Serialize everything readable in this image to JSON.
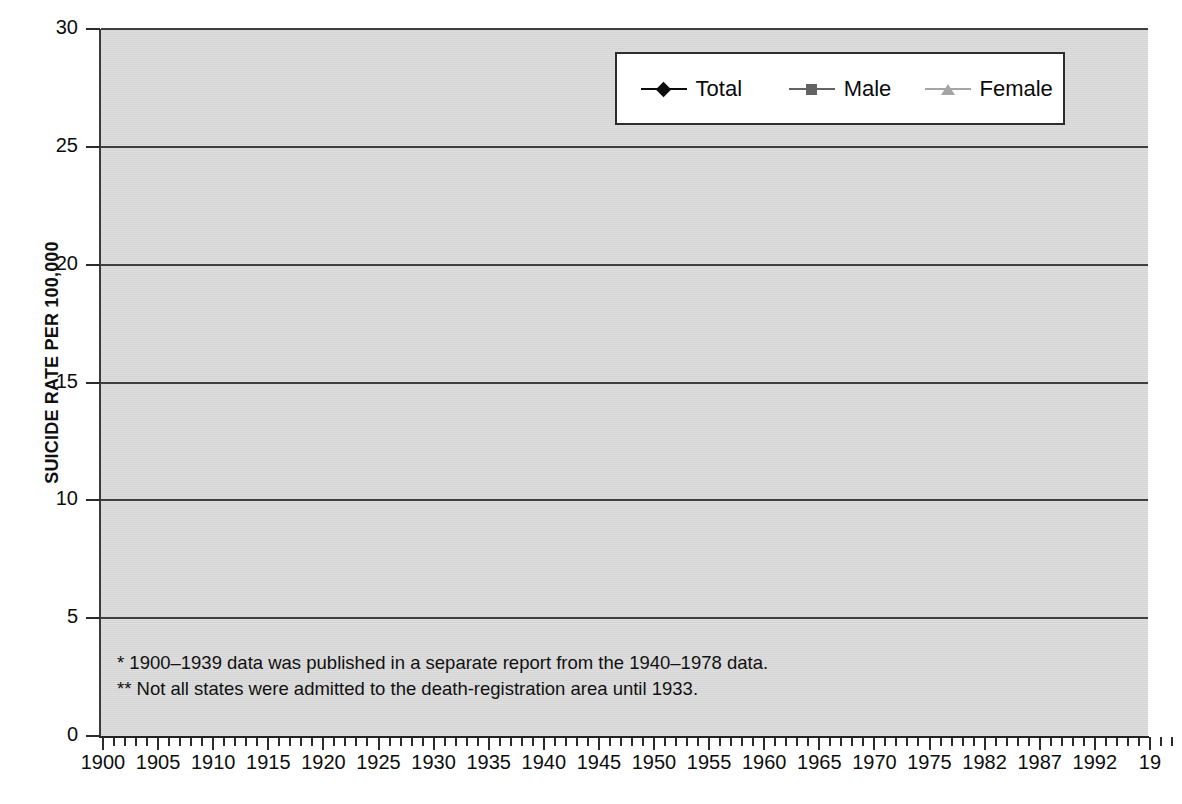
{
  "chart_data": {
    "type": "line",
    "title": "",
    "xlabel": "",
    "ylabel": "SUICIDE RATE PER 100,000",
    "ylim": [
      0,
      30
    ],
    "yticks": [
      0,
      5,
      10,
      15,
      20,
      25,
      30
    ],
    "xlim": [
      1900,
      1997
    ],
    "xtick_labels": [
      "1900",
      "1905",
      "1910",
      "1915",
      "1920",
      "1925",
      "1930",
      "1935",
      "1940",
      "1945",
      "1950",
      "1955",
      "1960",
      "1965",
      "1970",
      "1975",
      "1982",
      "1987",
      "1992",
      "19"
    ],
    "xtick_years": [
      1900,
      1905,
      1910,
      1915,
      1920,
      1925,
      1930,
      1935,
      1940,
      1945,
      1950,
      1955,
      1960,
      1965,
      1970,
      1975,
      1980,
      1985,
      1990,
      1995
    ],
    "grid": "horizontal",
    "legend_position": "top-right",
    "x": [
      1900,
      1901,
      1902,
      1903,
      1904,
      1905,
      1906,
      1907,
      1908,
      1909,
      1910,
      1911,
      1912,
      1913,
      1914,
      1915,
      1916,
      1917,
      1918,
      1919,
      1920,
      1921,
      1922,
      1923,
      1924,
      1925,
      1926,
      1927,
      1928,
      1929,
      1930,
      1931,
      1932,
      1933,
      1934,
      1935,
      1936,
      1937,
      1938,
      1939,
      1940,
      1941,
      1942,
      1943,
      1944,
      1945,
      1946,
      1947,
      1948,
      1949,
      1950,
      1951,
      1952,
      1953,
      1954,
      1955,
      1956,
      1957,
      1958,
      1959,
      1960,
      1961,
      1962,
      1963,
      1964,
      1965,
      1966,
      1967,
      1968,
      1969,
      1970,
      1971,
      1972,
      1973,
      1974,
      1975,
      1976,
      1977,
      1978,
      1979,
      1980,
      1981,
      1982,
      1983,
      1984,
      1985,
      1986,
      1987,
      1988,
      1989,
      1990,
      1991,
      1992,
      1993,
      1994,
      1995,
      1996,
      1997
    ],
    "series": [
      {
        "name": "Total",
        "color": "#0d0d0d",
        "marker": "diamond",
        "values": [
          11.3,
          11.6,
          11.6,
          12.2,
          13.4,
          14.9,
          14.3,
          16.1,
          18.6,
          17.6,
          17.4,
          17.5,
          17.1,
          17.0,
          17.6,
          17.9,
          15.3,
          14.6,
          13.1,
          12.8,
          11.5,
          13.9,
          13.2,
          12.9,
          13.4,
          14.1,
          14.6,
          15.1,
          15.4,
          16.9,
          18.0,
          18.6,
          17.0,
          15.7,
          15.4,
          15.0,
          15.5,
          15.3,
          14.4,
          14.3,
          12.0,
          10.2,
          10.1,
          11.5,
          11.6,
          11.6,
          11.4,
          11.6,
          11.2,
          11.4,
          11.3,
          10.4,
          10.1,
          10.1,
          10.2,
          10.2,
          10.0,
          9.8,
          10.7,
          10.6,
          10.6,
          10.4,
          11.0,
          11.4,
          11.2,
          11.4,
          10.9,
          10.8,
          10.7,
          11.1,
          11.6,
          11.7,
          12.0,
          12.0,
          12.1,
          12.7,
          12.5,
          13.1,
          12.5,
          12.4,
          11.9,
          12.0,
          12.2,
          12.1,
          12.4,
          12.5,
          12.8,
          12.7,
          12.4,
          12.2,
          12.4,
          12.2,
          12.0,
          12.1,
          12.0,
          11.9,
          11.6,
          11.4
        ]
      },
      {
        "name": "Male",
        "color": "#636363",
        "marker": "square",
        "values": [
          17.7,
          17.8,
          17.5,
          17.6,
          19.3,
          20.6,
          22.7,
          21.9,
          24.5,
          28.4,
          26.9,
          25.5,
          26.5,
          26.3,
          25.7,
          26.8,
          26.8,
          23.2,
          20.1,
          20.0,
          18.4,
          21.1,
          19.2,
          19.1,
          20.2,
          20.1,
          20.9,
          21.9,
          23.0,
          24.2,
          26.2,
          28.5,
          29.4,
          26.6,
          24.1,
          22.8,
          22.5,
          23.9,
          23.8,
          22.1,
          21.9,
          19.4,
          18.3,
          15.1,
          14.9,
          17.2,
          17.5,
          17.3,
          17.9,
          17.8,
          17.3,
          16.3,
          15.8,
          16.1,
          16.9,
          16.4,
          15.6,
          15.3,
          16.8,
          16.6,
          16.5,
          16.2,
          16.8,
          16.6,
          16.4,
          16.4,
          16.1,
          15.8,
          15.9,
          16.1,
          16.8,
          16.7,
          17.5,
          17.7,
          18.1,
          19.8,
          18.7,
          20.1,
          19.0,
          20.2,
          19.9,
          20.3,
          21.0,
          20.9,
          21.2,
          21.8,
          21.8,
          21.7,
          20.4,
          20.4,
          21.0,
          20.9,
          20.7,
          20.6,
          20.6,
          20.3,
          20.1,
          20.0
        ]
      },
      {
        "name": "Female",
        "color": "#a5a5a5",
        "marker": "triangle",
        "values": [
          5.0,
          5.7,
          5.8,
          5.6,
          6.8,
          7.3,
          7.2,
          6.2,
          8.3,
          8.1,
          7.9,
          8.0,
          8.0,
          8.1,
          8.4,
          7.6,
          7.2,
          7.0,
          6.4,
          6.3,
          6.2,
          6.4,
          6.3,
          6.3,
          6.8,
          6.8,
          7.0,
          7.2,
          7.4,
          7.6,
          7.0,
          7.0,
          7.1,
          7.0,
          7.1,
          7.2,
          7.0,
          6.8,
          5.7,
          3.8,
          5.4,
          5.6,
          3.8,
          5.4,
          5.6,
          5.0,
          5.0,
          4.9,
          4.7,
          4.8,
          4.5,
          4.6,
          4.4,
          4.6,
          4.4,
          4.2,
          4.4,
          4.5,
          5.0,
          5.1,
          5.0,
          5.3,
          5.9,
          6.2,
          6.0,
          6.3,
          6.3,
          6.3,
          6.4,
          6.6,
          6.9,
          6.8,
          6.7,
          6.6,
          6.5,
          6.6,
          6.2,
          6.1,
          6.0,
          5.8,
          5.5,
          5.5,
          5.5,
          5.4,
          5.4,
          5.2,
          5.0,
          4.9,
          4.9,
          4.9,
          4.8,
          4.7,
          4.6,
          4.6,
          4.5,
          4.4,
          4.3,
          4.3
        ]
      }
    ],
    "legend": [
      {
        "label": "Total",
        "color": "#0d0d0d",
        "marker": "diamond"
      },
      {
        "label": "Male",
        "color": "#636363",
        "marker": "square"
      },
      {
        "label": "Female",
        "color": "#a5a5a5",
        "marker": "triangle"
      }
    ],
    "annotations": [
      "*  1900–1939 data was published in a separate report from the 1940–1978 data.",
      "** Not all states were admitted to the death-registration area until 1933."
    ]
  },
  "colors": {
    "plot_background": "#d5d5d5",
    "page_background": "#ffffff",
    "gridline": "#3f3f3f",
    "axis": "#222222",
    "total": "#0d0d0d",
    "male": "#636363",
    "female": "#a5a5a5"
  }
}
